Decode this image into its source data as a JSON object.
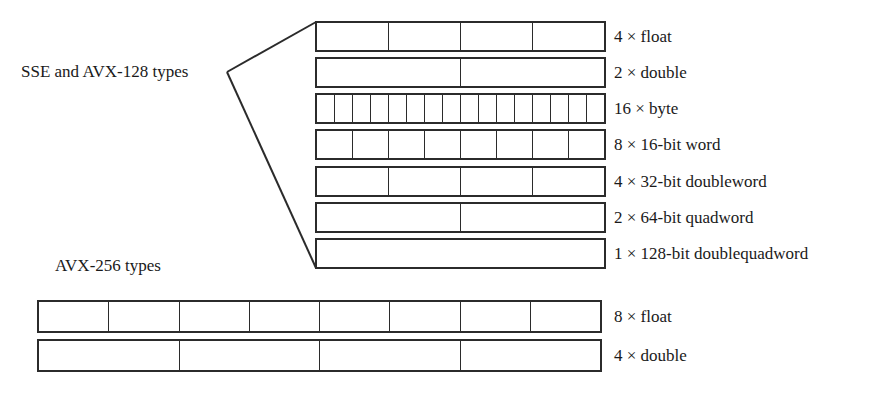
{
  "groups": {
    "sse": {
      "label": "SSE and AVX-128 types",
      "rows": [
        {
          "label": "4 × float",
          "cells": 4
        },
        {
          "label": "2 × double",
          "cells": 2
        },
        {
          "label": "16 × byte",
          "cells": 16
        },
        {
          "label": "8 × 16-bit word",
          "cells": 8
        },
        {
          "label": "4 × 32-bit doubleword",
          "cells": 4
        },
        {
          "label": "2 × 64-bit quadword",
          "cells": 2
        },
        {
          "label": "1 × 128-bit doublequadword",
          "cells": 1
        }
      ]
    },
    "avx256": {
      "label": "AVX-256 types",
      "rows": [
        {
          "label": "8 × float",
          "cells": 8
        },
        {
          "label": "4 × double",
          "cells": 4
        }
      ]
    }
  }
}
